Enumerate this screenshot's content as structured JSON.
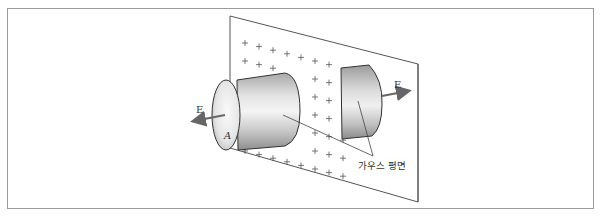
{
  "figure": {
    "labels": {
      "field_left": "E",
      "field_right": "E",
      "area": "A",
      "surface_caption": "가우스 평면"
    },
    "plane": {
      "charge_sign": "+",
      "charge_rows": 7
    },
    "colors": {
      "frame": "#9a9a9a",
      "plane_edge": "#555555",
      "cylinder_light": "#f2f2f2",
      "cylinder_dark": "#9a9a9a",
      "arrow": "#666666"
    }
  }
}
